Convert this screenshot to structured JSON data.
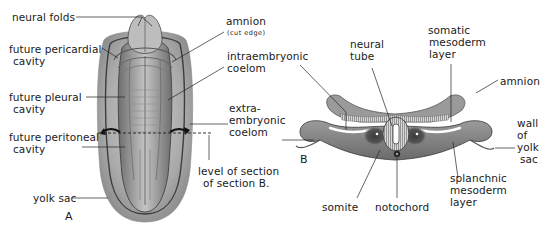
{
  "figure": {
    "panels": [
      {
        "id": "A",
        "label": "A",
        "description": "Embryo, dorsal view"
      },
      {
        "id": "B",
        "label": "B",
        "description": "Transverse section"
      }
    ],
    "panel_a_labels": {
      "neural_folds": "neural folds",
      "future_pericardial_cavity": [
        "future pericardial",
        "cavity"
      ],
      "future_pleural_cavity": [
        "future pleural",
        "cavity"
      ],
      "future_peritoneal_cavity": [
        "future peritoneal",
        "cavity"
      ],
      "yolk_sac": "yolk sac",
      "amnion": "amnion",
      "amnion_note": "(cut edge)",
      "intraembryonic_coelom": [
        "intraembryonic",
        "coelom"
      ],
      "extraembryonic_coelom": [
        "extra-",
        "embryonic",
        "coelom"
      ],
      "level_of_section": [
        "level of section",
        "of section B."
      ]
    },
    "panel_b_labels": {
      "neural_tube": [
        "neural",
        "tube"
      ],
      "somatic_mesoderm_layer": [
        "somatic",
        "mesoderm",
        "layer"
      ],
      "amnion": "amnion",
      "wall_of_yolk_sac": [
        "wall",
        "of",
        "yolk",
        "sac"
      ],
      "splanchnic_mesoderm_layer": [
        "splanchnic",
        "mesoderm",
        "layer"
      ],
      "notochord": "notochord",
      "somite": "somite"
    },
    "colors": {
      "ink": "#1a1a1a",
      "tissue_dark": "#5a5a5a",
      "tissue_mid": "#8c8c8c",
      "tissue_light": "#c8c8c8",
      "background": "#ffffff"
    }
  }
}
